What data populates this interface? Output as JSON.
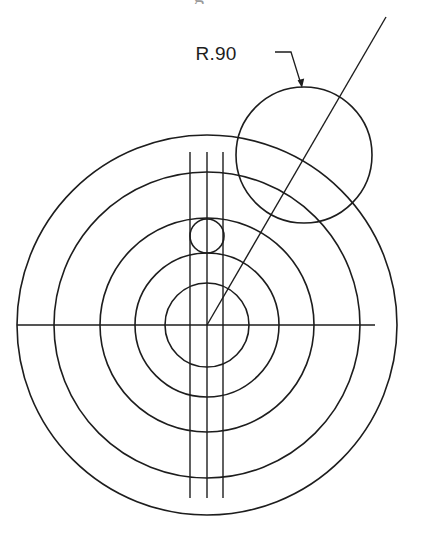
{
  "figure": {
    "background_color": "#ffffff",
    "line_color": "#1d1d1d",
    "width": 421,
    "height": 544
  },
  "annotations": {
    "radius_label": "R.90",
    "label_position": {
      "x": 216,
      "y": 60
    },
    "leader": {
      "start": {
        "x": 275,
        "y": 52
      },
      "elbow": {
        "x": 291,
        "y": 52
      },
      "tip": {
        "x": 302,
        "y": 87
      }
    }
  },
  "geometry": {
    "center": {
      "x": 207,
      "y": 325
    },
    "concentric_circles": [
      {
        "name": "outer-circle-1",
        "radius": 190
      },
      {
        "name": "circle-2",
        "radius": 153
      },
      {
        "name": "circle-3",
        "radius": 107
      },
      {
        "name": "circle-4",
        "radius": 72
      },
      {
        "name": "circle-5",
        "radius": 42
      }
    ],
    "small_circle": {
      "name": "small-circle",
      "cx": 207,
      "cy": 236,
      "radius": 17
    },
    "radius_circle": {
      "name": "r90-circle",
      "cx": 304,
      "cy": 155,
      "radius": 68
    },
    "vertical_lines": [
      {
        "name": "vertical-line-left",
        "x": 190,
        "y1": 152,
        "y2": 498
      },
      {
        "name": "vertical-line-center",
        "x": 207,
        "y1": 152,
        "y2": 498
      },
      {
        "name": "vertical-line-right",
        "x": 223,
        "y1": 152,
        "y2": 498
      }
    ],
    "horizontal_centerline": {
      "name": "horizontal-centerline",
      "x1": 17,
      "x2": 375,
      "y": 325
    },
    "diagonal_line": {
      "name": "diagonal-radius-line",
      "x1": 207,
      "y1": 325,
      "x2": 386,
      "y2": 17
    }
  },
  "partial_crop": {
    "glyph": "g"
  }
}
